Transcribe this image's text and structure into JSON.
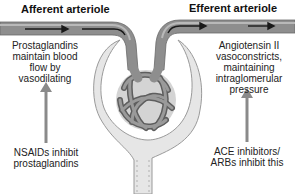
{
  "diagram": {
    "labels": {
      "afferent_title": "Afferent arteriole",
      "efferent_title": "Efferent arteriole",
      "afferent_note": "Prostaglandins maintain blood flow by vasodilating",
      "efferent_note": "Angiotensin II vasoconstricts, maintaining intraglomerular pressure",
      "nsaid_note": "NSAIDs inhibit prostaglandins",
      "ace_note": "ACE inhibitors/ ARBs inhibit this"
    },
    "components": [
      "afferent-arteriole",
      "efferent-arteriole",
      "glomerulus",
      "bowman-capsule",
      "renal-tubule"
    ],
    "arrows": [
      {
        "from": "nsaid_note",
        "to": "afferent_note",
        "direction": "up"
      },
      {
        "from": "ace_note",
        "to": "efferent_note",
        "direction": "up"
      }
    ],
    "colors": {
      "vessel": "#8e8e8e",
      "vessel_light": "#b9b9b9",
      "capsule": "#e4e4e4",
      "arrow": "#8a8a8a",
      "text": "#222222"
    }
  }
}
